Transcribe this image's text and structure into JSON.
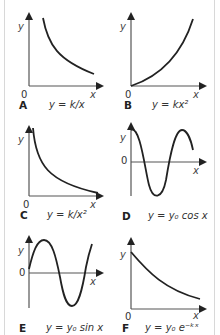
{
  "figure": {
    "panels": [
      {
        "id": "A",
        "letter": "A",
        "equation": "y = k/x",
        "xlabel": "x",
        "ylabel": "y",
        "origin": "0",
        "curve": "reciprocal"
      },
      {
        "id": "B",
        "letter": "B",
        "equation": "y = kx²",
        "xlabel": "x",
        "ylabel": "y",
        "origin": "0",
        "curve": "square"
      },
      {
        "id": "C",
        "letter": "C",
        "equation": "y = k/x²",
        "xlabel": "x",
        "ylabel": "y",
        "origin": "0",
        "curve": "inverse-square"
      },
      {
        "id": "D",
        "letter": "D",
        "equation": "y = y₀ cos x",
        "xlabel": "x",
        "ylabel": "y",
        "origin": "0",
        "curve": "cosine"
      },
      {
        "id": "E",
        "letter": "E",
        "equation": "y = y₀ sin x",
        "xlabel": "x",
        "ylabel": "y",
        "origin": "0",
        "curve": "sine"
      },
      {
        "id": "F",
        "letter": "F",
        "equation": "y = y₀ e⁻ᵏˣ",
        "xlabel": "x",
        "ylabel": "y",
        "origin": "0",
        "curve": "exponential-decay"
      }
    ],
    "colors": {
      "curve": "#222222",
      "axis": "#555555",
      "border": "#d8d8d8"
    }
  }
}
